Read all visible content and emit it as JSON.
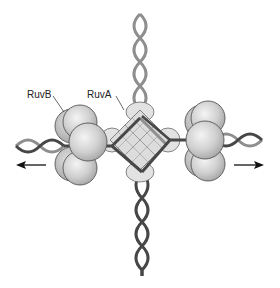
{
  "figure": {
    "labels": {
      "ruvb": "RuvB",
      "ruva": "RuvA"
    },
    "arrows": {
      "left": "left-arrow",
      "right": "right-arrow"
    },
    "components": [
      {
        "name": "RuvA",
        "shape": "tetramer square at junction center"
      },
      {
        "name": "RuvB",
        "shape": "hexameric rings of spheres on left and right DNA arms"
      },
      {
        "name": "DNA top arm",
        "color": "#8c8c8c"
      },
      {
        "name": "DNA bottom arm",
        "color": "#4a4a4a"
      },
      {
        "name": "DNA left arm",
        "color": "mixed light/dark"
      },
      {
        "name": "DNA right arm",
        "color": "mixed light/dark"
      }
    ],
    "colors": {
      "dna_light": "#8e8e8e",
      "dna_dark": "#474747",
      "protein_fill": "#d8d8d8",
      "protein_stroke": "#555555",
      "ruva_fill": "#e2e2e2",
      "arrow": "#111111"
    }
  }
}
